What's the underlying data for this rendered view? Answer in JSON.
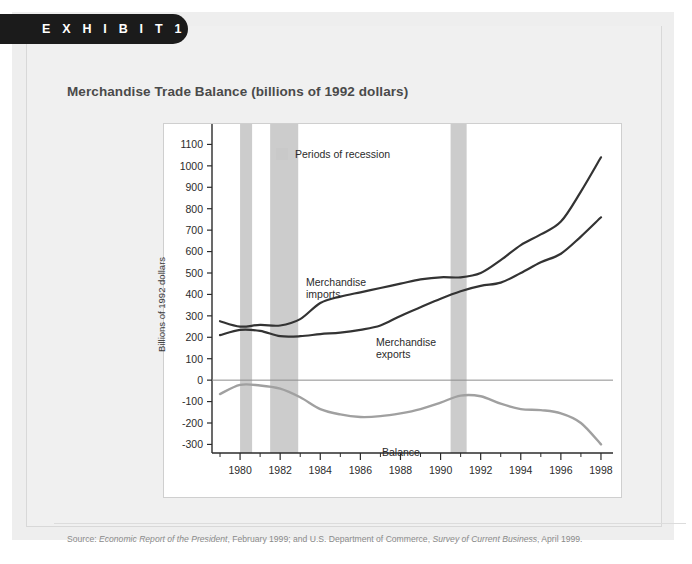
{
  "exhibit": {
    "label": "E X H I B I T   1"
  },
  "title": "Merchandise Trade Balance (billions of 1992 dollars)",
  "legend": {
    "recession_label": "Periods of recession",
    "swatch_color": "#c9c9c9"
  },
  "labels": {
    "imports_line1": "Merchandise",
    "imports_line2": "imports",
    "exports_line1": "Merchandise",
    "exports_line2": "exports",
    "balance": "Balance",
    "y_axis_title": "Billions of 1992 dollars"
  },
  "source": {
    "prefix": "Source:",
    "italic1": "Economic Report of the President",
    "mid": ", February 1999; and U.S. Department of Commerce,",
    "italic2": "Survey of Current Business",
    "suffix": ", April 1999."
  },
  "colors": {
    "imports": "#333333",
    "exports": "#333333",
    "balance": "#a0a0a0",
    "recession_band": "#cccccc",
    "axis": "#2b2b2b",
    "plot_bg": "#ffffff",
    "page_bg": "#eeeeee",
    "card_bg": "#f0f0f0",
    "tab_bg": "#1b1b1b",
    "title_color": "#4a4a4a"
  },
  "chart_data": {
    "type": "line",
    "title": "Merchandise Trade Balance (billions of 1992 dollars)",
    "xlabel": "",
    "ylabel": "Billions of 1992 dollars",
    "xlim": [
      1978.6,
      1998.6
    ],
    "ylim": [
      -340,
      1130
    ],
    "yticks": [
      1100,
      1000,
      900,
      800,
      700,
      600,
      500,
      400,
      300,
      200,
      100,
      0,
      -100,
      -200,
      -300
    ],
    "xticks": [
      1980,
      1982,
      1984,
      1986,
      1988,
      1990,
      1992,
      1994,
      1996,
      1998
    ],
    "xticks_minor": [
      1979,
      1981,
      1983,
      1985,
      1987,
      1989,
      1991,
      1993,
      1995,
      1997
    ],
    "grid": false,
    "zero_line": true,
    "legend_position": "top-left-inside",
    "x": [
      1979,
      1980,
      1981,
      1982,
      1983,
      1984,
      1985,
      1986,
      1987,
      1988,
      1989,
      1990,
      1991,
      1992,
      1993,
      1994,
      1995,
      1996,
      1997,
      1998
    ],
    "series": [
      {
        "name": "Merchandise imports",
        "color": "#333333",
        "values": [
          275,
          250,
          258,
          255,
          285,
          360,
          390,
          410,
          430,
          450,
          470,
          480,
          480,
          500,
          560,
          630,
          680,
          740,
          880,
          1040
        ]
      },
      {
        "name": "Merchandise exports",
        "color": "#333333",
        "values": [
          210,
          235,
          230,
          205,
          205,
          215,
          222,
          235,
          255,
          300,
          340,
          380,
          415,
          440,
          455,
          500,
          550,
          590,
          670,
          760
        ]
      },
      {
        "name": "Balance",
        "color": "#a0a0a0",
        "values": [
          -65,
          -22,
          -25,
          -40,
          -80,
          -135,
          -160,
          -172,
          -168,
          -155,
          -135,
          -105,
          -72,
          -75,
          -110,
          -135,
          -140,
          -155,
          -200,
          -300
        ]
      }
    ],
    "recession_bands": [
      {
        "start": 1980.0,
        "end": 1980.6
      },
      {
        "start": 1981.5,
        "end": 1982.9
      },
      {
        "start": 1990.5,
        "end": 1991.3
      }
    ]
  }
}
